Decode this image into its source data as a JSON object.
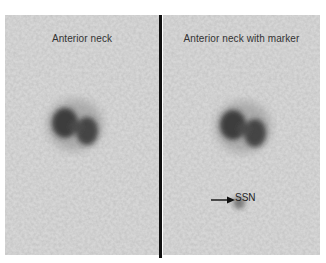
{
  "figure": {
    "type": "scintigraphy image",
    "panels": [
      {
        "title": "Anterior neck"
      },
      {
        "title": "Anterior neck with marker"
      }
    ],
    "marker": {
      "label": "SSN",
      "icon": "arrow-right-icon"
    },
    "colors": {
      "background": "#d4d4d4",
      "uptake": "#1e1e1e",
      "divider": "#111111"
    }
  }
}
